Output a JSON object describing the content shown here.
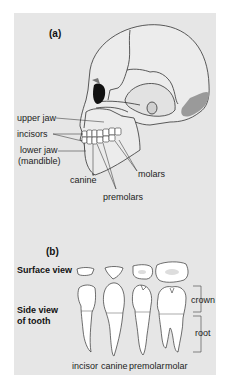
{
  "panel_a": {
    "label": "(a)",
    "labels": {
      "upper_jaw": "upper jaw",
      "incisors": "incisors",
      "lower_jaw": "lower jaw",
      "mandible": "(mandible)",
      "canine": "canine",
      "premolars": "premolars",
      "molars": "molars"
    }
  },
  "panel_b": {
    "label": "(b)",
    "row_labels": {
      "surface_view": "Surface view",
      "side_view_1": "Side view",
      "side_view_2": "of tooth"
    },
    "bracket_labels": {
      "crown": "crown",
      "root": "root"
    },
    "teeth": [
      {
        "name": "incisor"
      },
      {
        "name": "canine"
      },
      {
        "name": "premolar"
      },
      {
        "name": "molar"
      }
    ]
  },
  "colors": {
    "panel_bg": "#e6e6e6",
    "bone": "#e9e9e9",
    "tooth": "#ffffff",
    "outline": "#333333",
    "eye_socket": "#111111",
    "shade": "#999999"
  }
}
